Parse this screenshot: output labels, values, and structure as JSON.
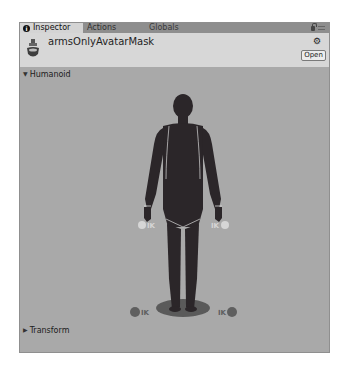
{
  "tabs": [
    {
      "label": "Inspector",
      "active": true,
      "icon": "info-icon"
    },
    {
      "label": "Actions",
      "active": false
    },
    {
      "label": "Globals",
      "active": false
    }
  ],
  "tab_tools": {
    "lock": "lock-icon",
    "menu": "menu-icon"
  },
  "header": {
    "asset_icon": "avatar-mask-icon",
    "title": "armsOnlyAvatarMask",
    "settings_icon": "gear-icon",
    "gear_glyph": "⚙",
    "open_label": "Open"
  },
  "sections": {
    "humanoid": {
      "label": "Humanoid",
      "expanded": true,
      "arrow": "▼"
    },
    "transform": {
      "label": "Transform",
      "expanded": false,
      "arrow": "▶"
    }
  },
  "ik_markers": {
    "left_hand": "IK",
    "right_hand": "IK",
    "left_foot": "IK",
    "right_foot": "IK"
  },
  "colors": {
    "panel_bg": "#a9a9a9",
    "header_bg": "#d7d7d7",
    "tabbar_bg": "#8e8e8e",
    "body_fill": "#2b2629",
    "ik_hand": "#d6d6d6",
    "ik_foot": "#5f5f5f",
    "shadow": "#5a5a5a"
  }
}
